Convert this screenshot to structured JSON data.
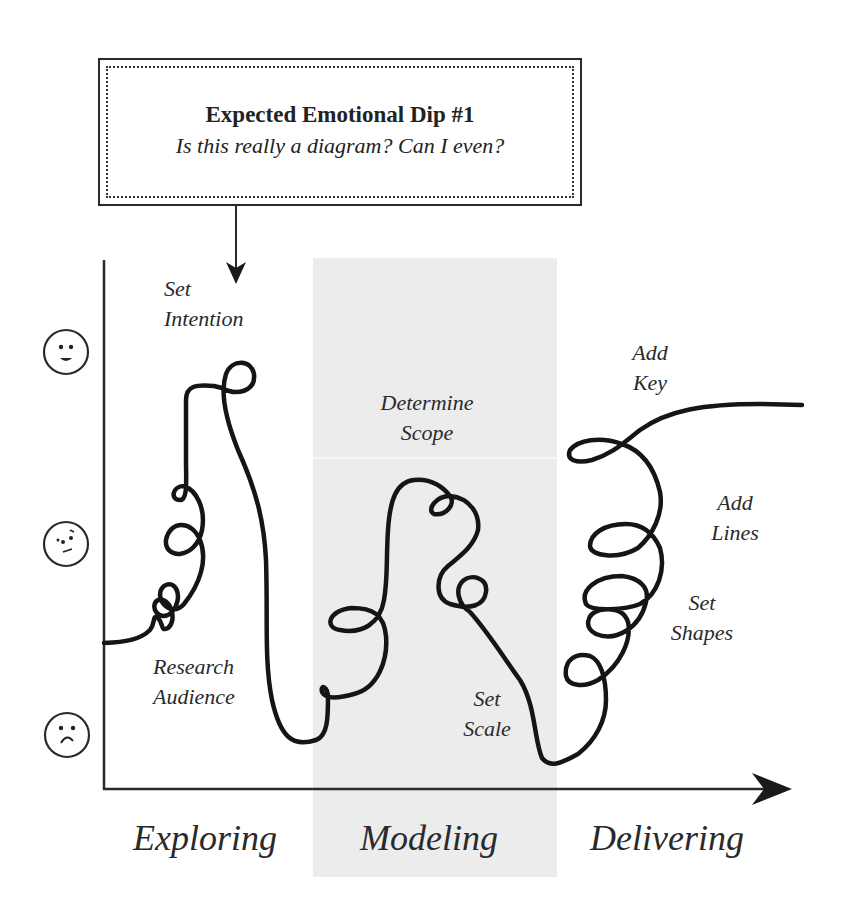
{
  "callout": {
    "title": "Expected Emotional Dip #1",
    "subtitle": "Is this really a diagram? Can I even?"
  },
  "y_axis": {
    "levels": [
      {
        "name": "happy",
        "icon": "happy-face-icon"
      },
      {
        "name": "unsure",
        "icon": "unsure-face-icon"
      },
      {
        "name": "sad",
        "icon": "sad-face-icon"
      }
    ]
  },
  "steps": {
    "set_intention": {
      "line1": "Set",
      "line2": "Intention"
    },
    "research_audience": {
      "line1": "Research",
      "line2": "Audience"
    },
    "determine_scope": {
      "line1": "Determine",
      "line2": "Scope"
    },
    "set_scale": {
      "line1": "Set",
      "line2": "Scale"
    },
    "add_key": {
      "line1": "Add",
      "line2": "Key"
    },
    "add_lines": {
      "line1": "Add",
      "line2": "Lines"
    },
    "set_shapes": {
      "line1": "Set",
      "line2": "Shapes"
    }
  },
  "phases": {
    "exploring": "Exploring",
    "modeling": "Modeling",
    "delivering": "Delivering"
  },
  "colors": {
    "ink": "#222222",
    "band": "#ececec",
    "background": "#ffffff"
  }
}
